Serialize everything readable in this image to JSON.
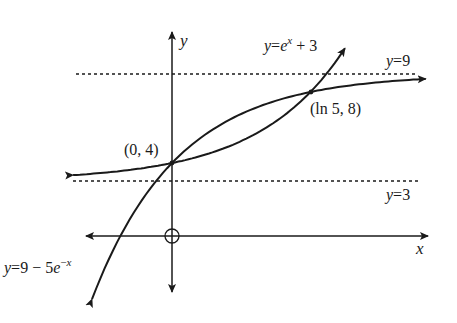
{
  "diagram": {
    "type": "function-graph",
    "axes": {
      "x_label": "x",
      "y_label": "y",
      "origin_marker": "circle"
    },
    "asymptotes": [
      {
        "id": "upper",
        "label": "y=9",
        "value": 9,
        "style": "dotted"
      },
      {
        "id": "lower",
        "label": "y=3",
        "value": 3,
        "style": "dotted"
      }
    ],
    "curves": [
      {
        "id": "exp-growth",
        "equation": "y = e^x + 3",
        "label_base": "y=e",
        "label_sup": "x",
        "label_tail": "+ 3"
      },
      {
        "id": "exp-decay",
        "equation": "y = 9 - 5e^(-x)",
        "label_base": "y=9 − 5e",
        "label_sup": "−x",
        "label_tail": ""
      }
    ],
    "points": [
      {
        "id": "p1",
        "label": "(0, 4)",
        "x": 0,
        "y": 4
      },
      {
        "id": "p2",
        "label": "(ln 5, 8)",
        "x": "ln 5",
        "y": 8
      }
    ]
  },
  "chart_data": {
    "type": "line",
    "title": "",
    "xlabel": "x",
    "ylabel": "y",
    "series": [
      {
        "name": "y=e^x+3",
        "formula": "e^x + 3",
        "x_range": [
          -1.15,
          2.01
        ]
      },
      {
        "name": "y=9-5e^(-x)",
        "formula": "9 - 5*e^(-x)",
        "x_range": [
          -0.93,
          2.95
        ]
      }
    ],
    "asymptotes": [
      9,
      3
    ],
    "intersections": [
      {
        "x": 0,
        "y": 4,
        "label": "(0,4)"
      },
      {
        "x": 1.609,
        "y": 8,
        "label": "(ln5,8)"
      }
    ],
    "grid": false
  }
}
